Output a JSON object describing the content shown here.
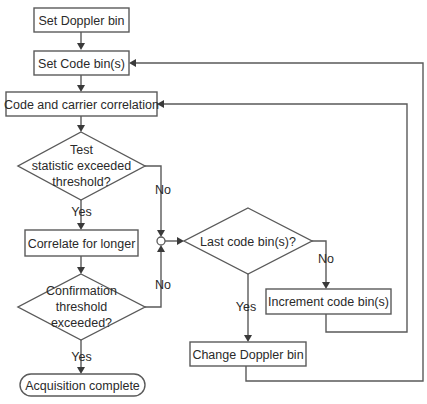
{
  "diagram": {
    "type": "flowchart",
    "nodes": {
      "set_doppler": {
        "label": "Set Doppler bin",
        "shape": "process"
      },
      "set_code": {
        "label": "Set Code bin(s)",
        "shape": "process"
      },
      "correlation": {
        "label": "Code and carrier correlation",
        "shape": "process"
      },
      "test_statistic": {
        "lines": [
          "Test",
          "statistic exceeded",
          "threshold?"
        ],
        "shape": "decision"
      },
      "correlate_longer": {
        "label": "Correlate for longer",
        "shape": "process"
      },
      "confirmation": {
        "lines": [
          "Confirmation",
          "threshold",
          "exceeded?"
        ],
        "shape": "decision"
      },
      "acquisition_complete": {
        "label": "Acquisition complete",
        "shape": "terminator"
      },
      "last_code_bin": {
        "label": "Last code bin(s)?",
        "shape": "decision"
      },
      "increment_code": {
        "label": "Increment code bin(s)",
        "shape": "process"
      },
      "change_doppler": {
        "label": "Change Doppler bin",
        "shape": "process"
      }
    },
    "edge_labels": {
      "test_yes": "Yes",
      "test_no": "No",
      "confirm_yes": "Yes",
      "confirm_no": "No",
      "last_yes": "Yes",
      "last_no": "No"
    },
    "edges": [
      {
        "from": "set_doppler",
        "to": "set_code"
      },
      {
        "from": "set_code",
        "to": "correlation"
      },
      {
        "from": "correlation",
        "to": "test_statistic"
      },
      {
        "from": "test_statistic",
        "to": "correlate_longer",
        "label": "Yes"
      },
      {
        "from": "test_statistic",
        "to": "junction",
        "label": "No"
      },
      {
        "from": "correlate_longer",
        "to": "confirmation"
      },
      {
        "from": "confirmation",
        "to": "acquisition_complete",
        "label": "Yes"
      },
      {
        "from": "confirmation",
        "to": "junction",
        "label": "No"
      },
      {
        "from": "junction",
        "to": "last_code_bin"
      },
      {
        "from": "last_code_bin",
        "to": "change_doppler",
        "label": "Yes"
      },
      {
        "from": "last_code_bin",
        "to": "increment_code",
        "label": "No"
      },
      {
        "from": "increment_code",
        "to": "correlation"
      },
      {
        "from": "change_doppler",
        "to": "set_code"
      }
    ]
  }
}
